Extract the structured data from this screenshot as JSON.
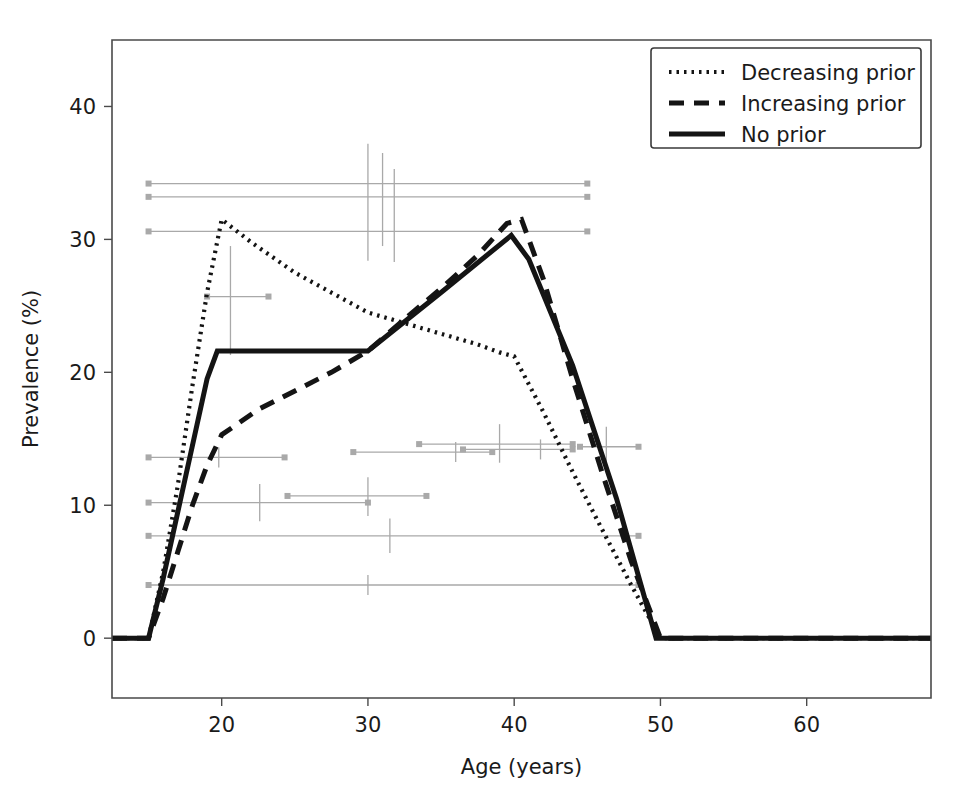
{
  "figure": {
    "title": "",
    "background_color": "#ffffff",
    "foreground_color": "#141414",
    "marker_color": "#a9a9a9"
  },
  "axes": {
    "xlabel": "Age (years)",
    "ylabel": "Prevalence (%)",
    "xticks": [
      20,
      30,
      40,
      50,
      60
    ],
    "xtick_labels": [
      "20",
      "30",
      "40",
      "50",
      "60"
    ],
    "yticks": [
      0,
      10,
      20,
      30,
      40
    ],
    "ytick_labels": [
      "0",
      "10",
      "20",
      "30",
      "40"
    ],
    "xlim": [
      12.5,
      68.5
    ],
    "ylim": [
      -4.5,
      45.0
    ],
    "grid": false
  },
  "legend": {
    "position": "upper right",
    "frame": true,
    "entries": [
      {
        "label": "Decreasing prior",
        "style": "dotted"
      },
      {
        "label": "Increasing prior",
        "style": "dashed"
      },
      {
        "label": "No prior",
        "style": "solid"
      }
    ]
  },
  "chart_data": {
    "type": "line",
    "title": "",
    "xlabel": "Age (years)",
    "ylabel": "Prevalence (%)",
    "xlim": [
      12.5,
      68.5
    ],
    "ylim": [
      -4.5,
      45.0
    ],
    "grid": false,
    "legend_position": "upper right",
    "series": [
      {
        "name": "Decreasing prior",
        "style": "dotted",
        "x": [
          12.5,
          15.0,
          16.0,
          17.0,
          18.0,
          19.0,
          20.0,
          22.0,
          25.0,
          27.5,
          30.0,
          32.5,
          35.0,
          37.5,
          39.0,
          40.0,
          42.0,
          44.0,
          46.0,
          48.0,
          50.0,
          68.5
        ],
        "y": [
          0.0,
          0.0,
          5.0,
          11.5,
          19.0,
          26.0,
          31.5,
          29.8,
          27.5,
          26.0,
          24.5,
          23.7,
          22.9,
          22.1,
          21.5,
          21.2,
          17.0,
          12.5,
          8.2,
          4.0,
          0.0,
          0.0
        ]
      },
      {
        "name": "Increasing prior",
        "style": "dashed",
        "x": [
          12.5,
          15.0,
          16.0,
          17.0,
          18.0,
          19.0,
          20.0,
          22.5,
          25.0,
          27.5,
          30.0,
          32.5,
          35.0,
          37.5,
          39.5,
          40.5,
          42.0,
          44.0,
          46.0,
          48.0,
          50.0,
          68.5
        ],
        "y": [
          0.0,
          0.0,
          3.0,
          6.5,
          10.0,
          13.0,
          15.3,
          17.2,
          18.6,
          20.0,
          21.6,
          24.0,
          26.3,
          28.8,
          31.2,
          31.5,
          27.0,
          19.5,
          12.5,
          5.8,
          0.0,
          0.0
        ]
      },
      {
        "name": "No prior",
        "style": "solid",
        "x": [
          12.5,
          15.0,
          16.0,
          17.0,
          18.0,
          19.0,
          19.7,
          30.0,
          35.0,
          39.8,
          41.0,
          44.0,
          47.0,
          49.7,
          50.0,
          68.5
        ],
        "y": [
          0.0,
          0.0,
          4.5,
          9.5,
          14.5,
          19.5,
          21.6,
          21.6,
          26.0,
          30.3,
          28.5,
          20.5,
          10.5,
          0.0,
          0.0,
          0.0
        ]
      }
    ],
    "data_markers": [
      {
        "y": 34.2,
        "x_low": 15.0,
        "x_high": 45.0,
        "x_center": null,
        "y_low": null,
        "y_high": null
      },
      {
        "y": 33.2,
        "x_low": 15.0,
        "x_high": 45.0,
        "x_center": null,
        "y_low": null,
        "y_high": null
      },
      {
        "y": 30.6,
        "x_low": 15.0,
        "x_high": 45.0,
        "x_center": null,
        "y_low": null,
        "y_high": null
      },
      {
        "y": 33.0,
        "x_low": null,
        "x_high": null,
        "x_center": 30.0,
        "y_low": 28.4,
        "y_high": 37.2
      },
      {
        "y": 33.0,
        "x_low": null,
        "x_high": null,
        "x_center": 31.0,
        "y_low": 29.5,
        "y_high": 36.5
      },
      {
        "y": 31.8,
        "x_low": null,
        "x_high": null,
        "x_center": 31.8,
        "y_low": 28.3,
        "y_high": 35.3
      },
      {
        "y": 25.7,
        "x_low": 19.0,
        "x_high": 23.2,
        "x_center": 20.6,
        "y_low": 21.3,
        "y_high": 29.5
      },
      {
        "y": 13.6,
        "x_low": 15.0,
        "x_high": 24.3,
        "x_center": 19.8,
        "y_low": null,
        "y_high": null
      },
      {
        "y": 14.0,
        "x_low": 29.0,
        "x_high": 38.5,
        "x_center": 36.0,
        "y_low": null,
        "y_high": null
      },
      {
        "y": 14.6,
        "x_low": 33.5,
        "x_high": 44.0,
        "x_center": 39.0,
        "y_low": 13.2,
        "y_high": 16.1
      },
      {
        "y": 14.2,
        "x_low": 36.5,
        "x_high": 44.0,
        "x_center": 41.8,
        "y_low": null,
        "y_high": null
      },
      {
        "y": 14.4,
        "x_low": 44.5,
        "x_high": 48.5,
        "x_center": 46.3,
        "y_low": 13.0,
        "y_high": 15.9
      },
      {
        "y": 10.2,
        "x_low": 15.0,
        "x_high": 30.0,
        "x_center": 22.6,
        "y_low": 8.8,
        "y_high": 11.6
      },
      {
        "y": 10.7,
        "x_low": 24.5,
        "x_high": 34.0,
        "x_center": 30.0,
        "y_low": 9.2,
        "y_high": 12.1
      },
      {
        "y": 7.7,
        "x_low": 15.0,
        "x_high": 48.5,
        "x_center": 31.5,
        "y_low": 6.4,
        "y_high": 9.0
      },
      {
        "y": 4.0,
        "x_low": 15.0,
        "x_high": 48.5,
        "x_center": 30.0,
        "y_low": null,
        "y_high": null
      }
    ]
  }
}
